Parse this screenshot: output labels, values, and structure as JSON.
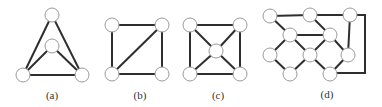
{
  "figure": {
    "subfigures": [
      {
        "id": "a",
        "label": "(a)",
        "label_pos": [
          52,
          99
        ],
        "nodes": [
          [
            52,
            15
          ],
          [
            52,
            46
          ],
          [
            23,
            75
          ],
          [
            82,
            75
          ]
        ],
        "edges": [
          [
            0,
            2
          ],
          [
            0,
            3
          ],
          [
            1,
            2
          ],
          [
            1,
            3
          ],
          [
            2,
            3
          ]
        ]
      },
      {
        "id": "b",
        "label": "(b)",
        "label_pos": [
          140,
          99
        ],
        "nodes": [
          [
            112,
            25
          ],
          [
            162,
            25
          ],
          [
            112,
            74
          ],
          [
            162,
            74
          ]
        ],
        "edges": [
          [
            0,
            1
          ],
          [
            0,
            2
          ],
          [
            1,
            3
          ],
          [
            2,
            3
          ],
          [
            1,
            2
          ]
        ]
      },
      {
        "id": "c",
        "label": "(c)",
        "label_pos": [
          218,
          99
        ],
        "nodes": [
          [
            190,
            25
          ],
          [
            240,
            25
          ],
          [
            216,
            51
          ],
          [
            190,
            74
          ],
          [
            240,
            74
          ]
        ],
        "edges": [
          [
            0,
            1
          ],
          [
            0,
            3
          ],
          [
            1,
            4
          ],
          [
            3,
            4
          ],
          [
            0,
            2
          ],
          [
            1,
            2
          ],
          [
            3,
            2
          ],
          [
            4,
            2
          ]
        ]
      },
      {
        "id": "d",
        "label": "(d)",
        "label_pos": [
          327,
          98
        ],
        "nodes": [
          [
            270,
            16
          ],
          [
            310,
            15
          ],
          [
            350,
            15
          ],
          [
            290,
            35
          ],
          [
            330,
            35
          ],
          [
            270,
            55
          ],
          [
            310,
            55
          ],
          [
            348,
            55
          ],
          [
            290,
            74
          ],
          [
            330,
            74
          ]
        ],
        "edges": [
          [
            0,
            1
          ],
          [
            1,
            2
          ],
          [
            0,
            3
          ],
          [
            1,
            4
          ],
          [
            3,
            4
          ],
          [
            3,
            5
          ],
          [
            3,
            6
          ],
          [
            4,
            6
          ],
          [
            4,
            7
          ],
          [
            5,
            8
          ],
          [
            6,
            8
          ],
          [
            6,
            9
          ],
          [
            7,
            9
          ],
          [
            2,
            7
          ]
        ],
        "polylines": [
          [
            [
              350,
              15
            ],
            [
              365,
              15
            ],
            [
              365,
              73
            ],
            [
              330,
              73
            ]
          ]
        ]
      }
    ],
    "node_radius": 7,
    "colors": {
      "edge": "#2e2e2e",
      "node_fill": "#ffffff",
      "node_stroke": "#9a9a9a",
      "label": "#333333"
    }
  }
}
